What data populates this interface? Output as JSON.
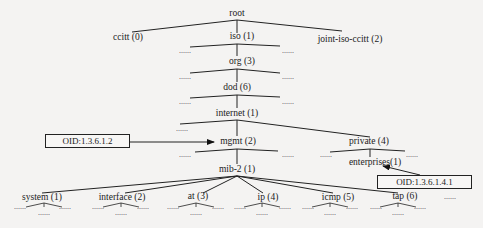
{
  "diagram": {
    "nodes": {
      "root": "root",
      "ccitt": "ccitt (0)",
      "iso": "iso (1)",
      "joint": "joint-iso-ccitt (2)",
      "org": "org (3)",
      "dod": "dod (6)",
      "internet": "internet (1)",
      "mgmt": "mgmt (2)",
      "private": "private (4)",
      "enterprises": "enterprises(1)",
      "mib2": "mib-2 (1)",
      "system": "system (1)",
      "interface": "interface (2)",
      "at": "at (3)",
      "ip": "ip (4)",
      "icmp": "icmp (5)",
      "tap": "tap (6)",
      "more": "......"
    },
    "ellipsis": "......",
    "oid_labels": {
      "mgmt_oid": "OID:1.3.6.1.2",
      "enterprises_oid": "OID:1.3.6.1.4.1"
    },
    "edges": [
      [
        "root",
        "ccitt"
      ],
      [
        "root",
        "iso"
      ],
      [
        "root",
        "joint-iso-ccitt"
      ],
      [
        "iso",
        "org"
      ],
      [
        "org",
        "dod"
      ],
      [
        "dod",
        "internet"
      ],
      [
        "internet",
        "mgmt"
      ],
      [
        "internet",
        "private"
      ],
      [
        "mgmt",
        "mib-2"
      ],
      [
        "private",
        "enterprises"
      ],
      [
        "mib-2",
        "system"
      ],
      [
        "mib-2",
        "interface"
      ],
      [
        "mib-2",
        "at"
      ],
      [
        "mib-2",
        "ip"
      ],
      [
        "mib-2",
        "icmp"
      ],
      [
        "mib-2",
        "tap"
      ]
    ],
    "arrows": [
      {
        "from": "OID:1.3.6.1.2",
        "to": "mgmt"
      },
      {
        "from": "OID:1.3.6.1.4.1",
        "to": "enterprises"
      }
    ]
  }
}
